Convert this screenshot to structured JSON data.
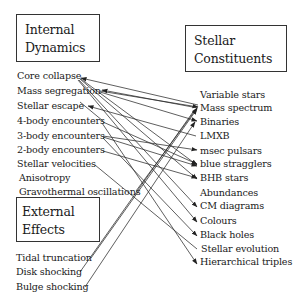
{
  "boxes": {
    "internal": {
      "line1": "Internal",
      "line2": "Dynamics"
    },
    "external": {
      "line1": "External",
      "line2": "Effects"
    },
    "stellar": {
      "line1": "Stellar",
      "line2": "Constituents"
    }
  },
  "internal_items": [
    "Core collapse",
    "Mass segregation",
    "Stellar escape",
    "4-body encounters",
    "3-body encounters",
    "2-body encounters",
    "Stellar velocities",
    "Anisotropy",
    "Gravothermal oscillations"
  ],
  "external_items": [
    "Tidal truncation",
    "Disk shocking",
    "Bulge shocking"
  ],
  "stellar_items": [
    "Variable stars",
    "Mass spectrum",
    "Binaries",
    "LMXB",
    "msec pulsars",
    "blue stragglers",
    "BHB stars",
    "Abundances",
    "CM diagrams",
    "Colours",
    "Black holes",
    "Stellar evolution",
    "Hierarchical triples"
  ],
  "connections": [
    {
      "from": "Core collapse",
      "to": "Mass spectrum",
      "arrow": "from"
    },
    {
      "from": "Core collapse",
      "to": "blue stragglers"
    },
    {
      "from": "Core collapse",
      "to": "BHB stars"
    },
    {
      "from": "Core collapse",
      "to": "CM diagrams"
    },
    {
      "from": "Core collapse",
      "to": "Colours"
    },
    {
      "from": "Mass segregation",
      "to": "Mass spectrum",
      "arrow": "both"
    },
    {
      "from": "Mass segregation",
      "to": "Binaries"
    },
    {
      "from": "Stellar escape",
      "to": "LMXB",
      "arrow": "from"
    },
    {
      "from": "4-body encounters",
      "to": "blue stragglers"
    },
    {
      "from": "4-body encounters",
      "to": "Hierarchical triples"
    },
    {
      "from": "3-body encounters",
      "to": "msec pulsars"
    },
    {
      "from": "3-body encounters",
      "to": "blue stragglers"
    },
    {
      "from": "3-body encounters",
      "to": "Black holes"
    },
    {
      "from": "2-body encounters",
      "to": "BHB stars"
    },
    {
      "from": "Stellar velocities",
      "to": "Stellar evolution"
    },
    {
      "from": "Gravothermal oscillations",
      "to": "Mass spectrum"
    },
    {
      "from": "Tidal truncation",
      "to": "Mass spectrum"
    },
    {
      "from": "Disk shocking",
      "to": "Mass spectrum"
    },
    {
      "from": "Bulge shocking",
      "to": "Binaries"
    }
  ]
}
